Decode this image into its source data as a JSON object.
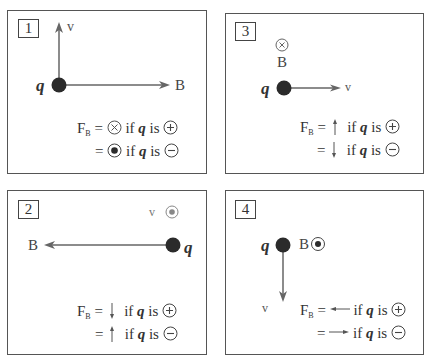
{
  "panels": [
    {
      "number": "1",
      "charge_label": "q",
      "velocity_label": "v",
      "field_label": "B",
      "velocity_direction": "up",
      "field_direction": "right",
      "formula": {
        "lhs": "F",
        "lhs_sub": "B",
        "eq": "=",
        "line1_symbol": "into-page-icon",
        "line1_text_if": "if",
        "line1_q": "q",
        "line1_text_is": "is",
        "line1_sign": "positive",
        "line2_symbol": "out-of-page-icon",
        "line2_sign": "negative"
      }
    },
    {
      "number": "2",
      "charge_label": "q",
      "velocity_label": "v",
      "field_label": "B",
      "velocity_direction": "out-of-page",
      "field_direction": "left",
      "formula": {
        "lhs": "F",
        "lhs_sub": "B",
        "eq": "=",
        "line1_symbol": "arrow-down-icon",
        "line1_text_if": "if",
        "line1_q": "q",
        "line1_text_is": "is",
        "line1_sign": "positive",
        "line2_symbol": "arrow-up-icon",
        "line2_sign": "negative"
      }
    },
    {
      "number": "3",
      "charge_label": "q",
      "velocity_label": "v",
      "field_label": "B",
      "velocity_direction": "right",
      "field_direction": "into-page",
      "formula": {
        "lhs": "F",
        "lhs_sub": "B",
        "eq": "=",
        "line1_symbol": "arrow-up-icon",
        "line1_text_if": "if",
        "line1_q": "q",
        "line1_text_is": "is",
        "line1_sign": "positive",
        "line2_symbol": "arrow-down-icon",
        "line2_sign": "negative"
      }
    },
    {
      "number": "4",
      "charge_label": "q",
      "velocity_label": "v",
      "field_label": "B",
      "velocity_direction": "down",
      "field_direction": "out-of-page",
      "formula": {
        "lhs": "F",
        "lhs_sub": "B",
        "eq": "=",
        "line1_symbol": "arrow-left-icon",
        "line1_text_if": "if",
        "line1_q": "q",
        "line1_text_is": "is",
        "line1_sign": "positive",
        "line2_symbol": "arrow-right-icon",
        "line2_sign": "negative"
      }
    }
  ],
  "colors": {
    "charge_dot": "#2b2b2b",
    "vector_line": "#666666",
    "border": "#555555",
    "text": "#333333"
  }
}
